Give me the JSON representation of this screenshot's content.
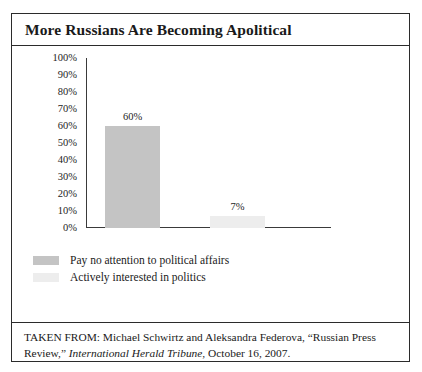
{
  "figure": {
    "title": "More Russians Are Becoming Apolitical",
    "source_prefix": "TAKEN FROM: Michael Schwirtz and Aleksandra Federova, “Russian Press Review,” ",
    "source_italic": "International Herald  Tribune",
    "source_suffix": ", October 16, 2007."
  },
  "colors": {
    "bar_dark": "#c4c4c4",
    "bar_light": "#ededed",
    "axis": "#3a3a3a",
    "frame": "#2b2b2b",
    "text": "#1a1a1a"
  },
  "chart_data": {
    "type": "bar",
    "title": "More Russians Are Becoming Apolitical",
    "xlabel": "",
    "ylabel": "",
    "ylim": [
      0,
      100
    ],
    "grid": false,
    "legend_position": "below-plot",
    "categories": [
      "Pay no attention to political affairs",
      "Actively interested in politics"
    ],
    "values": [
      60,
      7
    ],
    "value_labels": [
      "60%",
      "7%"
    ],
    "bar_colors": [
      "#c4c4c4",
      "#ededed"
    ],
    "ytick_labels": [
      "100%",
      "90%",
      "80%",
      "70%",
      "60%",
      "50%",
      "40%",
      "30%",
      "20%",
      "10%",
      "0%"
    ],
    "ytick_values": [
      100,
      90,
      80,
      70,
      60,
      50,
      40,
      30,
      20,
      10,
      0
    ],
    "legend": [
      {
        "label": "Pay no attention to political affairs",
        "color": "#c4c4c4"
      },
      {
        "label": "Actively interested in politics",
        "color": "#ededed"
      }
    ]
  }
}
